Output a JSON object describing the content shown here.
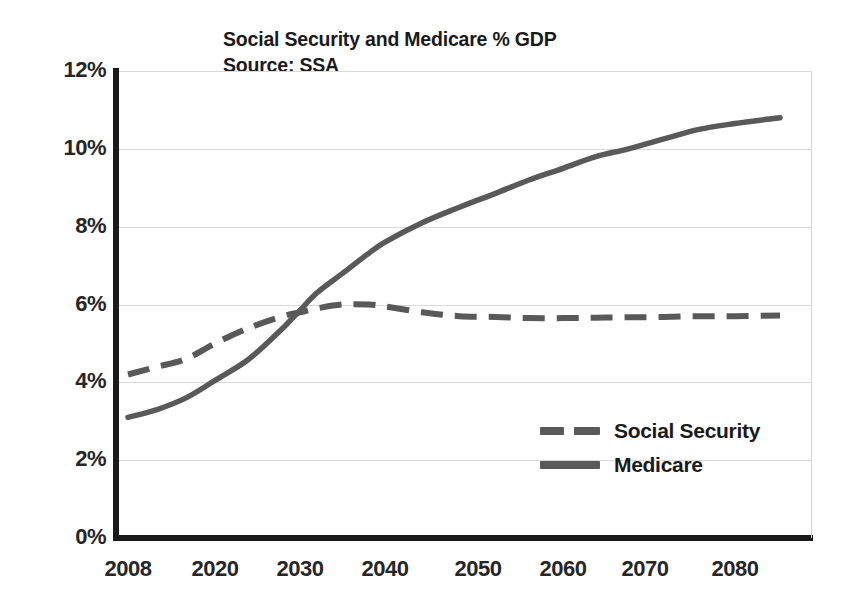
{
  "chart_data": {
    "type": "line",
    "title": "Social Security and Medicare % GDP",
    "subtitle": "Source: SSA",
    "xlabel": "",
    "ylabel": "",
    "ylim": [
      0,
      12
    ],
    "xlim": [
      2008,
      2085
    ],
    "grid": true,
    "legend_position": "inside-right",
    "y_ticks": [
      "0%",
      "2%",
      "4%",
      "6%",
      "8%",
      "10%",
      "12%"
    ],
    "y_tick_values": [
      0,
      2,
      4,
      6,
      8,
      10,
      12
    ],
    "x_ticks": [
      "2008",
      "2020",
      "2030",
      "2040",
      "2050",
      "2060",
      "2070",
      "2080"
    ],
    "x_tick_values": [
      2008,
      2020,
      2030,
      2040,
      2050,
      2060,
      2070,
      2080
    ],
    "series": [
      {
        "name": "Social Security",
        "style": "dashed",
        "color": "#595959",
        "x": [
          2008,
          2012,
          2016,
          2020,
          2024,
          2028,
          2030,
          2032,
          2035,
          2038,
          2040,
          2044,
          2048,
          2052,
          2056,
          2060,
          2064,
          2068,
          2072,
          2076,
          2080,
          2085
        ],
        "values": [
          4.2,
          4.4,
          4.6,
          5.0,
          5.4,
          5.7,
          5.8,
          5.9,
          6.0,
          6.0,
          5.95,
          5.8,
          5.7,
          5.68,
          5.65,
          5.65,
          5.66,
          5.67,
          5.68,
          5.7,
          5.7,
          5.72
        ]
      },
      {
        "name": "Medicare",
        "style": "solid",
        "color": "#595959",
        "x": [
          2008,
          2012,
          2016,
          2020,
          2024,
          2028,
          2030,
          2032,
          2035,
          2038,
          2040,
          2044,
          2048,
          2052,
          2056,
          2060,
          2064,
          2068,
          2072,
          2076,
          2080,
          2085
        ],
        "values": [
          3.1,
          3.3,
          3.6,
          4.05,
          4.6,
          5.4,
          5.85,
          6.3,
          6.8,
          7.3,
          7.6,
          8.1,
          8.5,
          8.85,
          9.2,
          9.5,
          9.8,
          10.0,
          10.25,
          10.5,
          10.65,
          10.8
        ]
      }
    ],
    "legend": [
      {
        "label": "Social Security",
        "style": "dashed"
      },
      {
        "label": "Medicare",
        "style": "solid"
      }
    ]
  }
}
